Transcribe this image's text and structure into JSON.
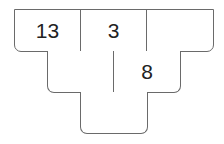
{
  "pyramid": {
    "rows": [
      {
        "cells": [
          "13",
          "3",
          ""
        ]
      },
      {
        "cells": [
          "",
          "8"
        ]
      },
      {
        "cells": [
          ""
        ]
      }
    ]
  }
}
